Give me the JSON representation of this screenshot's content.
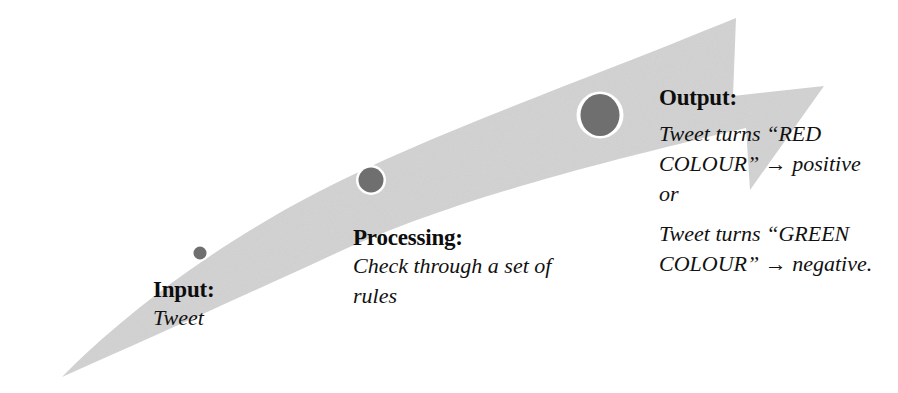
{
  "figure": {
    "type": "process-flow-arrow-diagram",
    "background_color": "#ffffff",
    "arrow_fill": "#d4d4d4",
    "node_fill": "#6f6f6f",
    "node_ring": "#ffffff",
    "text_color": "#111111"
  },
  "stages": [
    {
      "id": "input",
      "title": "Input:",
      "lines": [
        "Tweet"
      ],
      "node": {
        "name": "node-input",
        "cx": 200,
        "cy": 253,
        "r": 7
      }
    },
    {
      "id": "processing",
      "title": "Processing:",
      "lines": [
        "Check through a set of rules"
      ],
      "node": {
        "name": "node-processing",
        "cx": 371,
        "cy": 180,
        "r": 13
      }
    },
    {
      "id": "output",
      "title": "Output:",
      "lines": [
        "Tweet turns “RED COLOUR” → positive or",
        "Tweet turns “GREEN COLOUR” → negative."
      ],
      "node": {
        "name": "node-output",
        "cx": 600,
        "cy": 115,
        "r": 21
      }
    }
  ],
  "text": {
    "input_title": "Input:",
    "input_line1": "Tweet",
    "processing_title": "Processing:",
    "processing_line1": "Check through a set of rules",
    "output_title": "Output:",
    "output_line1": "Tweet turns “RED COLOUR” → positive or",
    "output_line2": "Tweet turns “GREEN COLOUR” → negative."
  }
}
